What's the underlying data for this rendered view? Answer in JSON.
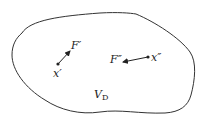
{
  "diagram": {
    "region_label": "V",
    "region_label_sub": "D",
    "point_1": {
      "label": "x′",
      "force_label": "F′"
    },
    "point_2": {
      "label": "x″",
      "force_label": "F″"
    },
    "colors": {
      "stroke": "#333333",
      "background": "#ffffff"
    }
  }
}
